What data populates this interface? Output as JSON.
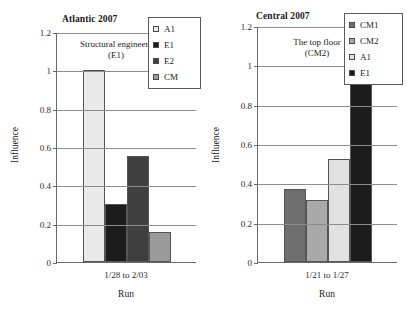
{
  "chart_data": [
    {
      "type": "bar",
      "title": "Atlantic 2007",
      "xlabel": "Run",
      "ylabel": "Influence",
      "categories": [
        "1/28 to 2/03"
      ],
      "ylim": [
        0,
        1.2
      ],
      "yticks": [
        "0",
        "0.2",
        "0.4",
        "0.6",
        "0.8",
        "1",
        "1.2"
      ],
      "ytick_values": [
        0,
        0.2,
        0.4,
        0.6,
        0.8,
        1,
        1.2
      ],
      "grid": true,
      "legend_position": "top-right",
      "annotation": "Structural engineers\n(E1)",
      "annotation_line1": "Structural engineers",
      "annotation_line2": "(E1)",
      "series": [
        {
          "name": "A1",
          "value": 1.0,
          "color": "#e9e9e9"
        },
        {
          "name": "E1",
          "value": 0.305,
          "color": "#1c1c1c"
        },
        {
          "name": "E2",
          "value": 0.555,
          "color": "#3f3f3f"
        },
        {
          "name": "CM",
          "value": 0.155,
          "color": "#9b9b9b"
        }
      ]
    },
    {
      "type": "bar",
      "title": "Central 2007",
      "xlabel": "Run",
      "ylabel": "Influence",
      "categories": [
        "1/21 to 1/27"
      ],
      "ylim": [
        0,
        1.2
      ],
      "yticks": [
        "0",
        "0.2",
        "0.4",
        "0.6",
        "0.8",
        "1",
        "1.2"
      ],
      "ytick_values": [
        0,
        0.2,
        0.4,
        0.6,
        0.8,
        1,
        1.2
      ],
      "grid": true,
      "legend_position": "top-right",
      "annotation": "The top floor\n(CM2)",
      "annotation_line1": "The top floor",
      "annotation_line2": "(CM2)",
      "series": [
        {
          "name": "CM1",
          "value": 0.37,
          "color": "#6f6f6f"
        },
        {
          "name": "CM2",
          "value": 0.315,
          "color": "#a9a9a9"
        },
        {
          "name": "A1",
          "value": 0.525,
          "color": "#e1e1e1"
        },
        {
          "name": "E1",
          "value": 1.0,
          "color": "#1c1c1c"
        }
      ]
    }
  ]
}
